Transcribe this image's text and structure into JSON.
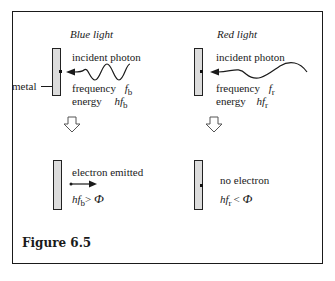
{
  "figure": {
    "caption": "Figure 6.5",
    "metal_label": "metal",
    "panels": {
      "blue": {
        "title": "Blue light",
        "incident_label": "incident photon",
        "frequency_label": "frequency",
        "frequency_symbol": "f",
        "frequency_sub": "b",
        "energy_label": "energy",
        "energy_symbol": "hf",
        "energy_sub": "b",
        "result_label": "electron emitted",
        "condition_lhs": "hf",
        "condition_sub": "b",
        "condition_op": ">",
        "condition_rhs": "Φ"
      },
      "red": {
        "title": "Red light",
        "incident_label": "incident photon",
        "frequency_label": "frequency",
        "frequency_symbol": "f",
        "frequency_sub": "r",
        "energy_label": "energy",
        "energy_symbol": "hf",
        "energy_sub": "r",
        "result_label": "no electron",
        "condition_lhs": "hf",
        "condition_sub": "r",
        "condition_op": "<",
        "condition_rhs": "Φ"
      }
    },
    "icons": {
      "transition_arrow": "hollow-down-arrow",
      "photon": "wavy-arrow",
      "electron": "straight-arrow"
    },
    "colors": {
      "ink": "#1a1a1a",
      "metal_fill": "#dcdcdc",
      "background": "#ffffff"
    }
  }
}
